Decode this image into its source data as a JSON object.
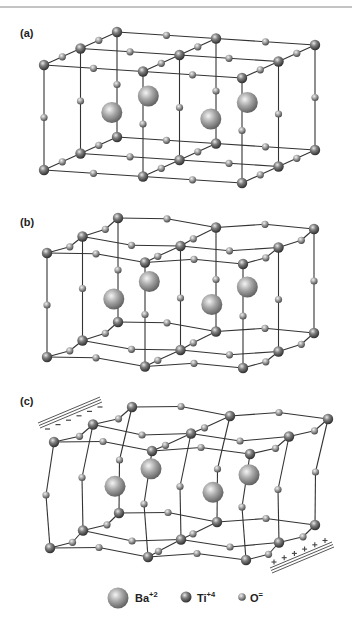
{
  "figure": {
    "panels": [
      {
        "id": "a",
        "label": "(a)",
        "state": "cubic"
      },
      {
        "id": "b",
        "label": "(b)",
        "state": "distorted"
      },
      {
        "id": "c",
        "label": "(c)",
        "state": "polarized",
        "top_plate_charge": "−",
        "bottom_plate_charge": "+",
        "top_plate_sign_count": 6,
        "bottom_plate_sign_count": 6
      }
    ],
    "legend": [
      {
        "species": "Ba",
        "charge": "+2",
        "size": "large"
      },
      {
        "species": "Ti",
        "charge": "+4",
        "size": "medium"
      },
      {
        "species": "O",
        "charge": "=",
        "size": "small"
      }
    ]
  },
  "colors": {
    "bond": "#333333",
    "atom_light": "#f2f2f2",
    "atom_mid": "#9a9a9a",
    "atom_dark": "#3c3c3c",
    "plate": "#444444",
    "top_rule": "#888888"
  }
}
